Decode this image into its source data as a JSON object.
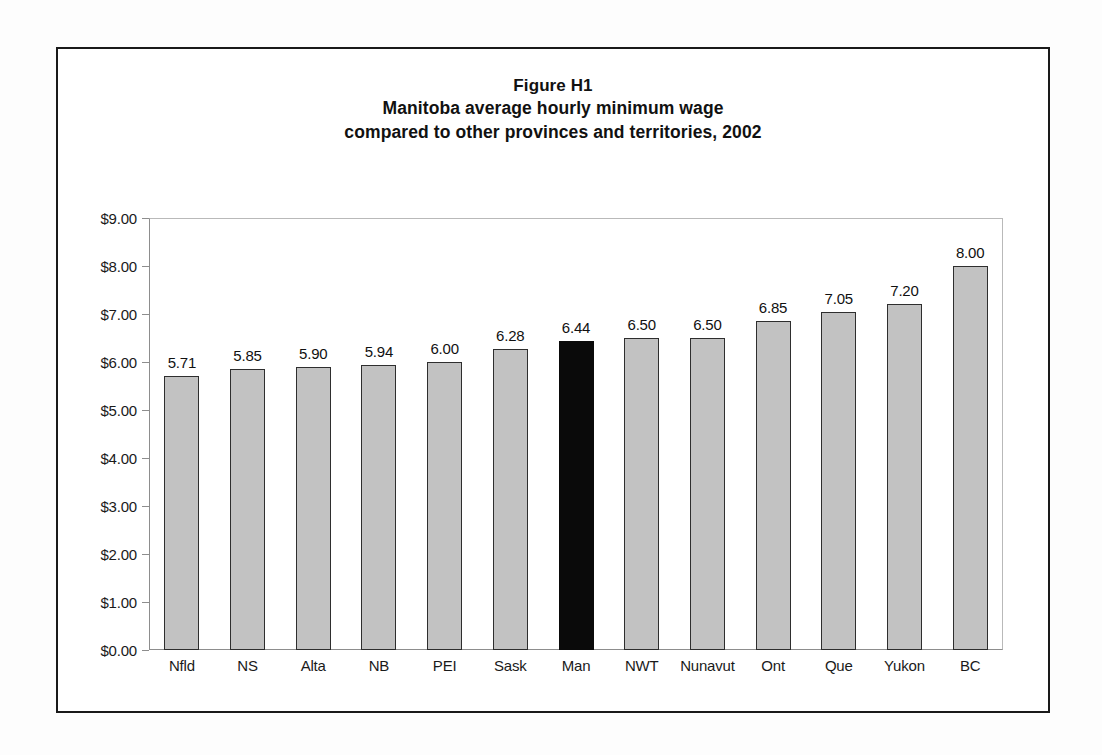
{
  "figure": {
    "frame_color": "#1a1a1a",
    "background": "#ffffff",
    "title_lines": [
      "Figure H1",
      "Manitoba average hourly minimum wage",
      "compared to other provinces and territories, 2002"
    ]
  },
  "chart_data": {
    "type": "bar",
    "title": "Figure H1 Manitoba average hourly minimum wage compared to other provinces and territories, 2002",
    "xlabel": "",
    "ylabel": "",
    "ylim": [
      0,
      9
    ],
    "grid": false,
    "legend": "none",
    "y_tick_labels": [
      "$0.00",
      "$1.00",
      "$2.00",
      "$3.00",
      "$4.00",
      "$5.00",
      "$6.00",
      "$7.00",
      "$8.00",
      "$9.00"
    ],
    "y_tick_values": [
      0,
      1,
      2,
      3,
      4,
      5,
      6,
      7,
      8,
      9
    ],
    "categories": [
      "Nfld",
      "NS",
      "Alta",
      "NB",
      "PEI",
      "Sask",
      "Man",
      "NWT",
      "Nunavut",
      "Ont",
      "Que",
      "Yukon",
      "BC"
    ],
    "values": [
      5.71,
      5.85,
      5.9,
      5.94,
      6.0,
      6.28,
      6.44,
      6.5,
      6.5,
      6.85,
      7.05,
      7.2,
      8.0
    ],
    "value_labels": [
      "5.71",
      "5.85",
      "5.90",
      "5.94",
      "6.00",
      "6.28",
      "6.44",
      "6.50",
      "6.50",
      "6.85",
      "7.05",
      "7.20",
      "8.00"
    ],
    "highlight_category": "Man",
    "highlight_index": 6,
    "bar_fill": "#c2c2c2",
    "bar_edge": "#2e2e2e",
    "highlight_fill": "#0a0a0a"
  }
}
